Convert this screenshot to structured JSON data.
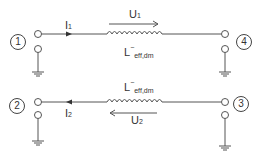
{
  "diagram": {
    "ports": [
      {
        "id": "1",
        "label": "1"
      },
      {
        "id": "2",
        "label": "2"
      },
      {
        "id": "3",
        "label": "3"
      },
      {
        "id": "4",
        "label": "4"
      }
    ],
    "top_branch": {
      "current_label": "I",
      "current_sub": "1",
      "voltage_label": "U",
      "voltage_sub": "1",
      "inductor_label": "L",
      "inductor_sup": "−",
      "inductor_sub": "eff,dm"
    },
    "bottom_branch": {
      "current_label": "I",
      "current_sub": "2",
      "voltage_label": "U",
      "voltage_sub": "2",
      "inductor_label": "L",
      "inductor_sup": "−",
      "inductor_sub": "eff,dm"
    },
    "colors": {
      "line": "#555555",
      "text": "#333333"
    }
  }
}
